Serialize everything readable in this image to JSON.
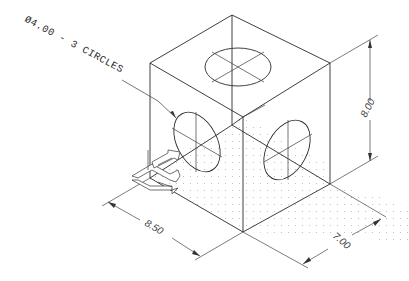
{
  "drawing": {
    "title": "Isometric cube with three circular holes",
    "background": "#ffffff",
    "line_color": "#2a2a2a",
    "grid_dot_color": "#b8b8b8",
    "leader_note": "Ø4.00 - 3 CIRCLES",
    "dimensions": {
      "height": "8.00",
      "width": "8.50",
      "depth": "7.00"
    },
    "icons": {
      "ucs": "ucs-axis-icon"
    }
  }
}
